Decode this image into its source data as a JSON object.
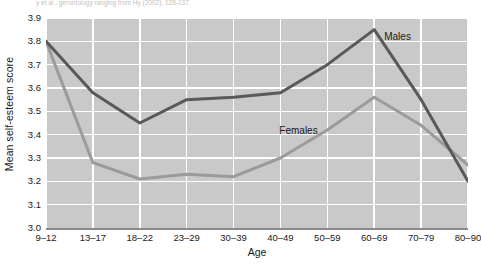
{
  "caption": {
    "text": "y et al., gerontology ranging from Hy (2002), 128-137."
  },
  "chart_data": {
    "type": "line",
    "title": "",
    "xlabel": "Age",
    "ylabel": "Mean self-esteem score",
    "categories": [
      "9–12",
      "13–17",
      "18–22",
      "23–29",
      "30–39",
      "40–49",
      "50–59",
      "60–69",
      "70–79",
      "80–90"
    ],
    "yticks": [
      "3.0",
      "3.1",
      "3.2",
      "3.3",
      "3.4",
      "3.5",
      "3.6",
      "3.7",
      "3.8",
      "3.9"
    ],
    "ylim": [
      3.0,
      3.9
    ],
    "grid": true,
    "legend_position": "inline-annotation",
    "series": [
      {
        "name": "Males",
        "color": "#595959",
        "values": [
          3.8,
          3.58,
          3.45,
          3.55,
          3.56,
          3.58,
          3.7,
          3.85,
          3.55,
          3.2
        ]
      },
      {
        "name": "Females",
        "color": "#9b9b9b",
        "values": [
          3.8,
          3.28,
          3.21,
          3.23,
          3.22,
          3.3,
          3.42,
          3.56,
          3.44,
          3.27
        ]
      }
    ],
    "annotations": [
      {
        "text": "Males",
        "series": "Males"
      },
      {
        "text": "Females",
        "series": "Females"
      }
    ],
    "plot_background": "#c9c9c9",
    "gridline_color": "#ffffff"
  }
}
